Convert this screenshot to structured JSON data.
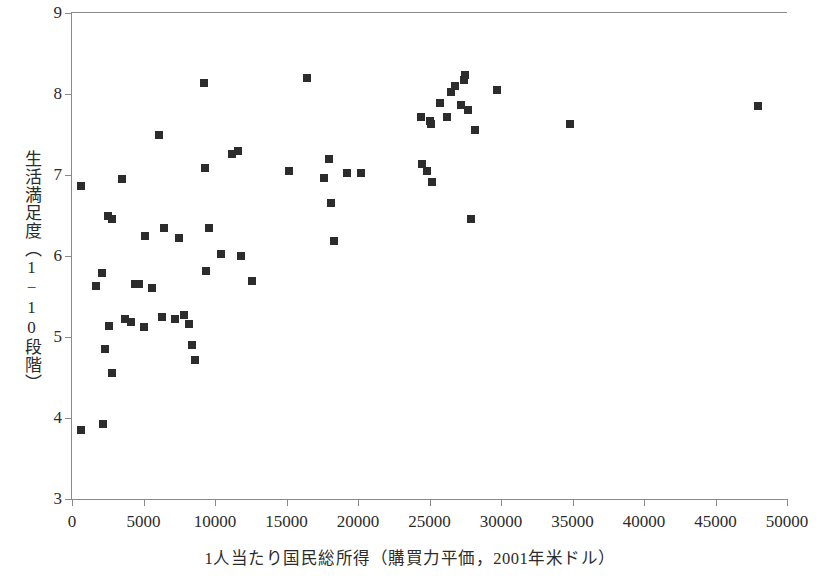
{
  "chart_data": {
    "type": "scatter",
    "title": "",
    "xlabel": "1人当たり国民総所得（購買力平価，2001年米ドル）",
    "ylabel": "生活満足度（1−10段階）",
    "xlim": [
      0,
      50000
    ],
    "ylim": [
      3,
      9
    ],
    "xticks": [
      0,
      5000,
      10000,
      15000,
      20000,
      25000,
      30000,
      35000,
      40000,
      45000,
      50000
    ],
    "yticks": [
      3,
      4,
      5,
      6,
      7,
      8,
      9
    ],
    "xtick_labels": [
      "0",
      "5000",
      "10000",
      "15000",
      "20000",
      "25000",
      "30000",
      "35000",
      "40000",
      "45000",
      "50000"
    ],
    "ytick_labels": [
      "3",
      "4",
      "5",
      "6",
      "7",
      "8",
      "9"
    ],
    "grid": false,
    "legend": null,
    "marker": "square",
    "marker_color": "#2c2c2c",
    "marker_size_px": 8,
    "points": [
      [
        600,
        6.87
      ],
      [
        600,
        3.85
      ],
      [
        1700,
        5.63
      ],
      [
        2100,
        5.79
      ],
      [
        2200,
        3.92
      ],
      [
        2300,
        4.85
      ],
      [
        2500,
        6.5
      ],
      [
        2600,
        5.13
      ],
      [
        2800,
        6.46
      ],
      [
        2800,
        4.56
      ],
      [
        3500,
        6.95
      ],
      [
        3700,
        5.22
      ],
      [
        4100,
        5.19
      ],
      [
        4400,
        5.65
      ],
      [
        4700,
        5.66
      ],
      [
        5000,
        5.12
      ],
      [
        5100,
        6.25
      ],
      [
        5600,
        5.6
      ],
      [
        6100,
        7.5
      ],
      [
        6300,
        5.25
      ],
      [
        6400,
        6.35
      ],
      [
        7200,
        5.22
      ],
      [
        7500,
        6.22
      ],
      [
        7800,
        5.27
      ],
      [
        8200,
        5.16
      ],
      [
        8400,
        4.9
      ],
      [
        8600,
        4.72
      ],
      [
        9200,
        8.14
      ],
      [
        9300,
        7.09
      ],
      [
        9400,
        5.82
      ],
      [
        9600,
        6.35
      ],
      [
        10400,
        6.02
      ],
      [
        11200,
        7.26
      ],
      [
        11600,
        7.3
      ],
      [
        11800,
        6.0
      ],
      [
        12600,
        5.69
      ],
      [
        15200,
        7.05
      ],
      [
        16400,
        8.2
      ],
      [
        17600,
        6.96
      ],
      [
        18000,
        7.2
      ],
      [
        18100,
        6.65
      ],
      [
        18300,
        6.19
      ],
      [
        19200,
        7.03
      ],
      [
        20200,
        7.03
      ],
      [
        24400,
        7.71
      ],
      [
        24500,
        7.14
      ],
      [
        24800,
        7.05
      ],
      [
        25000,
        7.67
      ],
      [
        25100,
        7.63
      ],
      [
        25200,
        6.91
      ],
      [
        25700,
        7.89
      ],
      [
        26200,
        7.72
      ],
      [
        26500,
        8.03
      ],
      [
        26800,
        8.1
      ],
      [
        27200,
        7.86
      ],
      [
        27400,
        8.17
      ],
      [
        27500,
        8.23
      ],
      [
        27700,
        7.8
      ],
      [
        27900,
        6.46
      ],
      [
        28200,
        7.55
      ],
      [
        29700,
        8.05
      ],
      [
        34800,
        7.63
      ],
      [
        48000,
        7.85
      ]
    ]
  }
}
